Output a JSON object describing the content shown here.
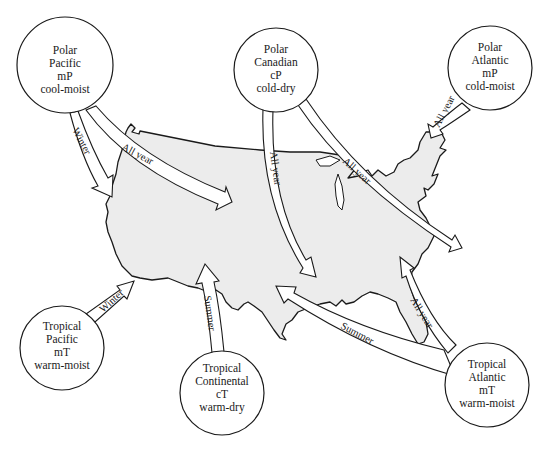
{
  "figure": {
    "type": "air-mass-map",
    "region": "United States",
    "colors": {
      "land": "#ececec",
      "outline": "#1a1a1a",
      "circle_fill": "#ffffff",
      "background": "#ffffff"
    }
  },
  "air_masses": [
    {
      "id": "polar-pacific",
      "lines": [
        "Polar",
        "Pacific",
        "mP",
        "cool-moist"
      ]
    },
    {
      "id": "polar-canadian",
      "lines": [
        "Polar",
        "Canadian",
        "cP",
        "cold-dry"
      ]
    },
    {
      "id": "polar-atlantic",
      "lines": [
        "Polar",
        "Atlantic",
        "mP",
        "cold-moist"
      ]
    },
    {
      "id": "tropical-pacific",
      "lines": [
        "Tropical",
        "Pacific",
        "mT",
        "warm-moist"
      ]
    },
    {
      "id": "tropical-continental",
      "lines": [
        "Tropical",
        "Continental",
        "cT",
        "warm-dry"
      ]
    },
    {
      "id": "tropical-atlantic",
      "lines": [
        "Tropical",
        "Atlantic",
        "mT",
        "warm-moist"
      ]
    }
  ],
  "arrows": [
    {
      "id": "polar-pacific-winter",
      "from": "polar-pacific",
      "label": "Winter"
    },
    {
      "id": "polar-pacific-all-year",
      "from": "polar-pacific",
      "label": "All year"
    },
    {
      "id": "polar-canadian-all-year-south",
      "from": "polar-canadian",
      "label": "All year"
    },
    {
      "id": "polar-canadian-all-year-east",
      "from": "polar-canadian",
      "label": "All year"
    },
    {
      "id": "polar-atlantic-all-year",
      "from": "polar-atlantic",
      "label": "All year"
    },
    {
      "id": "tropical-pacific-winter",
      "from": "tropical-pacific",
      "label": "Winter"
    },
    {
      "id": "tropical-continental-summer",
      "from": "tropical-continental",
      "label": "Summer"
    },
    {
      "id": "tropical-atlantic-summer",
      "from": "tropical-atlantic",
      "label": "Summer"
    },
    {
      "id": "tropical-atlantic-all-year",
      "from": "tropical-atlantic",
      "label": "All year"
    }
  ]
}
